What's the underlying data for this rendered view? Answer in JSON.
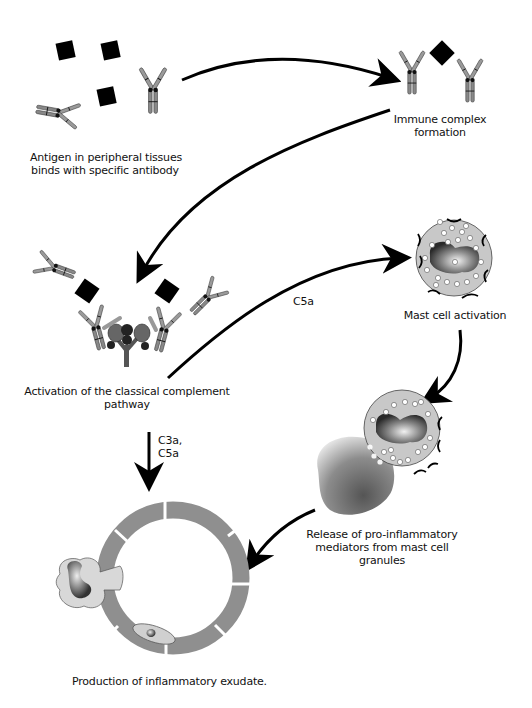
{
  "diagram": {
    "type": "flow",
    "title": "",
    "steps": [
      {
        "id": "antigen",
        "label_line1": "Antigen in peripheral tissues",
        "label_line2": "binds with specific antibody"
      },
      {
        "id": "immune_complex",
        "label_line1": "Immune complex",
        "label_line2": "formation"
      },
      {
        "id": "complement",
        "label_line1": "Activation of the classical complement",
        "label_line2": "pathway"
      },
      {
        "id": "mast_activation",
        "label": "Mast cell activation"
      },
      {
        "id": "mediator_release",
        "label_line1": "Release of pro-inflammatory",
        "label_line2": "mediators from mast cell",
        "label_line3": "granules"
      },
      {
        "id": "exudate",
        "label": "Production of inflammatory exudate."
      }
    ],
    "edges": [
      {
        "from": "antigen",
        "to": "immune_complex",
        "label": ""
      },
      {
        "from": "immune_complex",
        "to": "complement",
        "label": ""
      },
      {
        "from": "complement",
        "to": "mast_activation",
        "label": "C5a"
      },
      {
        "from": "mast_activation",
        "to": "mediator_release",
        "label": ""
      },
      {
        "from": "complement",
        "to": "exudate",
        "label_line1": "C3a,",
        "label_line2": "C5a"
      },
      {
        "from": "mediator_release",
        "to": "exudate",
        "label": ""
      }
    ]
  }
}
